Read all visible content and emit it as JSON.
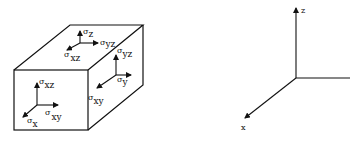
{
  "figure": {
    "cube": {
      "top_face": {
        "normal": {
          "symbol": "σ",
          "subscript": "z"
        },
        "shear_1": {
          "symbol": "σ",
          "subscript": "yz"
        },
        "shear_2": {
          "symbol": "σ",
          "subscript": "xz"
        }
      },
      "right_face": {
        "shear_1": {
          "symbol": "σ",
          "subscript": "yz"
        },
        "normal": {
          "symbol": "σ",
          "subscript": "y"
        },
        "shear_2": {
          "symbol": "σ",
          "subscript": "xy"
        }
      },
      "front_face": {
        "shear_1": {
          "symbol": "σ",
          "subscript": "xz"
        },
        "shear_2": {
          "symbol": "σ",
          "subscript": "xy"
        },
        "normal": {
          "symbol": "σ",
          "subscript": "x"
        }
      }
    },
    "axes": {
      "z_label": "z",
      "x_label": "x",
      "y_label": ""
    }
  },
  "colors": {
    "line": "#111111",
    "background": "#ffffff"
  }
}
